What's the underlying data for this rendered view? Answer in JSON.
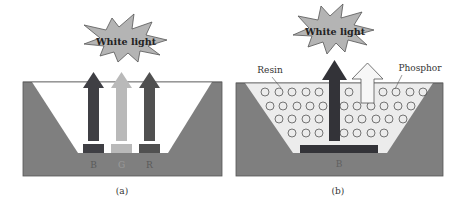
{
  "panel_a": {
    "caption": "(a)",
    "burst_label": "White light",
    "chips": [
      {
        "label": "B",
        "color": "#3f3f44",
        "arrow_color": "#3f3f44"
      },
      {
        "label": "G",
        "color": "#b9b9b9",
        "arrow_color": "#b9b9b9"
      },
      {
        "label": "R",
        "color": "#505050",
        "arrow_color": "#505050"
      }
    ]
  },
  "panel_b": {
    "caption": "(b)",
    "burst_label": "White light",
    "resin_label": "Resin",
    "phosphor_label": "Phosphor",
    "chip_label": "B"
  },
  "colors": {
    "housing": "#7f7f7f",
    "cup_a": "#ffffff",
    "cup_b": "#ececec",
    "burst": "#b4b4b4",
    "dark_arrow": "#333338",
    "phosphor_arrow": "#f7f7f7"
  }
}
